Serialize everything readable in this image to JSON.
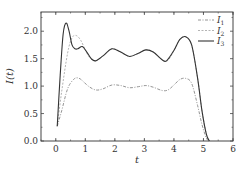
{
  "chart_data": {
    "type": "line",
    "title": "",
    "xlabel": "t",
    "ylabel": "I(t)",
    "xlim": [
      -0.5,
      6
    ],
    "ylim": [
      0.0,
      2.35
    ],
    "xticks": [
      0,
      1,
      2,
      3,
      4,
      5,
      6
    ],
    "xtick_labels": [
      "0",
      "1",
      "2",
      "3",
      "4",
      "5",
      "6"
    ],
    "yticks": [
      0.0,
      0.5,
      1.0,
      1.5,
      2.0
    ],
    "ytick_labels": [
      "0.0",
      "0.5",
      "1.0",
      "1.5",
      "2.0"
    ],
    "grid": false,
    "legend_position": "upper right",
    "series": [
      {
        "name": "I1",
        "label_main": "I",
        "label_sub": "1",
        "style": "dash-dot",
        "color": "#888888",
        "x": [
          0.05,
          0.2,
          0.4,
          0.6,
          0.75,
          0.9,
          1.1,
          1.35,
          1.6,
          1.9,
          2.2,
          2.5,
          2.8,
          3.05,
          3.3,
          3.6,
          3.8,
          4.0,
          4.2,
          4.4,
          4.6,
          4.8,
          4.95,
          5.1,
          5.2
        ],
        "y": [
          0.27,
          0.55,
          0.95,
          1.12,
          1.15,
          1.1,
          1.0,
          0.93,
          0.95,
          1.02,
          1.01,
          0.97,
          0.99,
          1.01,
          0.98,
          0.92,
          0.93,
          1.02,
          1.12,
          1.14,
          1.05,
          0.65,
          0.3,
          0.05,
          0.0
        ]
      },
      {
        "name": "I2",
        "label_main": "I",
        "label_sub": "2",
        "style": "dashed",
        "color": "#aaaaaa",
        "x": [
          0.05,
          0.2,
          0.4,
          0.55,
          0.7,
          0.85,
          1.0,
          1.15,
          1.35,
          1.6,
          1.9,
          2.2,
          2.5,
          2.8,
          3.05,
          3.3,
          3.6,
          3.8,
          4.0,
          4.2,
          4.4,
          4.6,
          4.8,
          4.95,
          5.1,
          5.2
        ],
        "y": [
          0.27,
          0.9,
          1.6,
          1.88,
          1.92,
          1.83,
          1.66,
          1.52,
          1.46,
          1.55,
          1.68,
          1.62,
          1.54,
          1.6,
          1.66,
          1.62,
          1.48,
          1.47,
          1.65,
          1.85,
          1.9,
          1.75,
          1.15,
          0.55,
          0.12,
          0.0
        ]
      },
      {
        "name": "I3",
        "label_main": "I",
        "label_sub": "3",
        "style": "solid",
        "color": "#333333",
        "x": [
          0.05,
          0.15,
          0.25,
          0.35,
          0.45,
          0.55,
          0.65,
          0.75,
          0.9,
          1.05,
          1.2,
          1.35,
          1.6,
          1.9,
          2.2,
          2.5,
          2.8,
          3.05,
          3.3,
          3.6,
          3.75,
          4.0,
          4.2,
          4.4,
          4.6,
          4.8,
          4.95,
          5.1,
          5.2
        ],
        "y": [
          0.27,
          1.2,
          1.95,
          2.15,
          2.0,
          1.75,
          1.68,
          1.68,
          1.72,
          1.62,
          1.5,
          1.46,
          1.55,
          1.68,
          1.62,
          1.54,
          1.6,
          1.66,
          1.62,
          1.48,
          1.46,
          1.65,
          1.85,
          1.9,
          1.75,
          1.15,
          0.55,
          0.12,
          0.0
        ]
      }
    ]
  }
}
